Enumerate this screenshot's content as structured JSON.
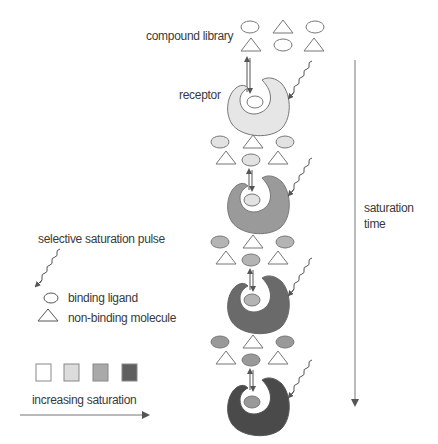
{
  "labels": {
    "compound_library": "compound library",
    "receptor": "receptor",
    "saturation_time_line1": "saturation",
    "saturation_time_line2": "time",
    "selective_pulse": "selective saturation pulse",
    "binding_ligand": "binding ligand",
    "non_binding": "non-binding molecule",
    "increasing_saturation": "increasing saturation"
  },
  "colors": {
    "outline": "#777777",
    "saturation_levels": [
      "#ffffff",
      "#dcdcdc",
      "#a9a9a9",
      "#5f5f5f"
    ],
    "receptor_fill_by_stage": [
      "#e6e6e6",
      "#9a9a9a",
      "#6a6a6a",
      "#4a4a4a"
    ],
    "ligand_fill_by_stage": [
      "#ffffff",
      "#e2e2e2",
      "#b4b4b4",
      "#999999"
    ]
  },
  "stages": [
    {
      "index": 1,
      "receptor_saturation": "low",
      "ligand_saturation": "none"
    },
    {
      "index": 2,
      "receptor_saturation": "medium",
      "ligand_saturation": "low"
    },
    {
      "index": 3,
      "receptor_saturation": "high",
      "ligand_saturation": "medium"
    },
    {
      "index": 4,
      "receptor_saturation": "full",
      "ligand_saturation": "high"
    }
  ]
}
